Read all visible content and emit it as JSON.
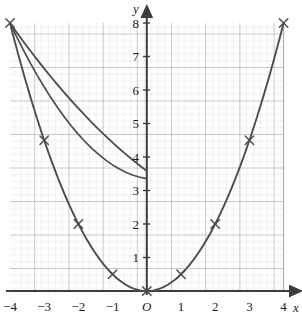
{
  "chart_data": {
    "type": "line",
    "title": "",
    "subtitle": "",
    "xlabel": "x",
    "ylabel": "y",
    "origin_label": "O",
    "xlim": [
      -4,
      4
    ],
    "ylim": [
      0,
      8
    ],
    "grid": "graph-paper",
    "grid_major_step_x": 1,
    "grid_major_step_y": 1,
    "grid_minor_per_major": 5,
    "legend": "none",
    "xticks": [
      -4,
      -3,
      -2,
      -1,
      0,
      1,
      2,
      3,
      4
    ],
    "xtick_labels": [
      "−4",
      "−3",
      "−2",
      "−1",
      "O",
      "1",
      "2",
      "3",
      "4"
    ],
    "yticks": [
      1,
      2,
      3,
      4,
      5,
      6,
      7,
      8
    ],
    "ytick_labels": [
      "1",
      "2",
      "3",
      "4",
      "5",
      "6",
      "7",
      "8"
    ],
    "series": [
      {
        "name": "y = x²/2",
        "marker": "x",
        "marker_color": "#4d4d4d",
        "line_color": "#4d4d4d",
        "x": [
          -4,
          -3,
          -2,
          -1,
          0,
          1,
          2,
          3,
          4
        ],
        "values": [
          8,
          4.5,
          2,
          0.5,
          0,
          0.5,
          2,
          4.5,
          8
        ]
      }
    ],
    "axis_arrows": [
      "x-positive",
      "y-positive"
    ],
    "colors": {
      "axis": "#3c3c3c",
      "curve": "#4d4d4d",
      "grid_major": "#9a9a9a",
      "grid_minor": "#cfcfcf",
      "text": "#1a1a1a",
      "background": "#ffffff"
    }
  },
  "axes": {
    "y_axis_name": "y",
    "x_axis_name": "x"
  }
}
